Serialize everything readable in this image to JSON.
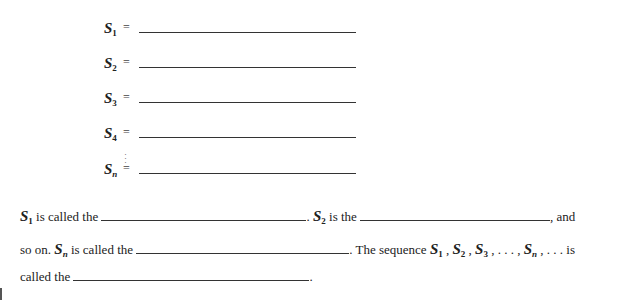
{
  "definitions": [
    {
      "symbol": "S",
      "sub": "1",
      "eq": "="
    },
    {
      "symbol": "S",
      "sub": "2",
      "eq": "="
    },
    {
      "symbol": "S",
      "sub": "3",
      "eq": "="
    },
    {
      "symbol": "S",
      "sub": "4",
      "eq": "="
    },
    {
      "symbol": "S",
      "sub": "n",
      "eq": "="
    }
  ],
  "ellipsis_vertical": "⋮",
  "paragraph": {
    "line1": {
      "s1": "S",
      "s1_sub": "1",
      "t1": " is called  the ",
      "t2": ". ",
      "s2": "S",
      "s2_sub": "2",
      "t3": " is the ",
      "t4": ", and"
    },
    "line2": {
      "t1": "so on. ",
      "sn": "S",
      "sn_sub": "n",
      "t2": " is called the ",
      "t3": ". The sequence  ",
      "seq": [
        {
          "s": "S",
          "sub": "1"
        },
        {
          "s": "S",
          "sub": "2"
        },
        {
          "s": "S",
          "sub": "3"
        },
        {
          "s": "S",
          "sub": "n"
        }
      ],
      "sep": " , ",
      "mid_dots": " . . . , ",
      "tail": " , . . . is"
    },
    "line3": {
      "t1": "called the ",
      "t2": "."
    }
  }
}
